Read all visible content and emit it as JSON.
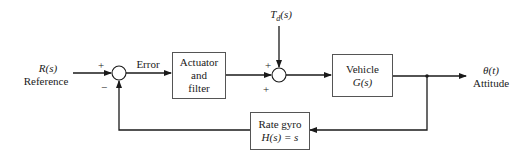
{
  "diagram": {
    "input": {
      "symbol": "R(s)",
      "label": "Reference"
    },
    "error_label": "Error",
    "disturbance": {
      "symbol": "T_d(s)",
      "base": "T",
      "subscript": "d",
      "arg": "(s)"
    },
    "output": {
      "symbol": "θ(t)",
      "label": "Attitude"
    },
    "blocks": {
      "actuator": {
        "lines": [
          "Actuator",
          "and",
          "filter"
        ]
      },
      "vehicle": {
        "lines": [
          "Vehicle",
          "G(s)"
        ]
      },
      "rate_gyro": {
        "lines": [
          "Rate gyro",
          "H(s) = s"
        ]
      }
    },
    "summing_junction_1": {
      "signs": {
        "top": "+",
        "bottom": "−"
      }
    },
    "summing_junction_2": {
      "signs": {
        "top": "+",
        "bottom": "+"
      }
    },
    "colors": {
      "line": "#1a1a1a",
      "box_border": "#555555",
      "background": "#ffffff"
    }
  }
}
